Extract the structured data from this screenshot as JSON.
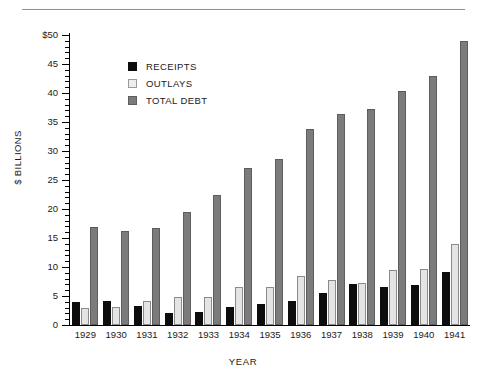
{
  "figure": {
    "has_top_rule": true,
    "background": "#ffffff"
  },
  "chart_data": {
    "type": "bar",
    "title": "",
    "xlabel": "YEAR",
    "ylabel": "$ BILLIONS",
    "categories": [
      "1929",
      "1930",
      "1931",
      "1932",
      "1933",
      "1934",
      "1935",
      "1936",
      "1937",
      "1938",
      "1939",
      "1940",
      "1941"
    ],
    "series": [
      {
        "name": "RECEIPTS",
        "color": "#0d0d0d",
        "values": [
          3.9,
          4.2,
          3.3,
          2.1,
          2.2,
          3.1,
          3.7,
          4.1,
          5.6,
          7.0,
          6.6,
          6.9,
          9.2
        ]
      },
      {
        "name": "OUTLAYS",
        "color": "#e4e4e4",
        "values": [
          2.9,
          3.1,
          4.2,
          4.9,
          4.8,
          6.6,
          6.5,
          8.4,
          7.7,
          7.3,
          9.4,
          9.6,
          14.0
        ]
      },
      {
        "name": "TOTAL DEBT",
        "color": "#7b7b7b",
        "values": [
          16.9,
          16.2,
          16.8,
          19.5,
          22.5,
          27.1,
          28.7,
          33.8,
          36.4,
          37.2,
          40.4,
          43.0,
          49.0
        ]
      }
    ],
    "ylim": [
      0,
      50
    ],
    "yticks": [
      0,
      5,
      10,
      15,
      20,
      25,
      30,
      35,
      40,
      45,
      50
    ],
    "ytick_labels": [
      "0",
      "5",
      "10",
      "15",
      "20",
      "25",
      "30",
      "35",
      "40",
      "45",
      "$50"
    ],
    "minor_tick_interval": 1,
    "grid": false,
    "legend_position": "upper-center-left"
  },
  "legend": {
    "items": [
      {
        "label": "RECEIPTS",
        "swatch": "receipts"
      },
      {
        "label": "OUTLAYS",
        "swatch": "outlays"
      },
      {
        "label": "TOTAL DEBT",
        "swatch": "debt"
      }
    ]
  }
}
